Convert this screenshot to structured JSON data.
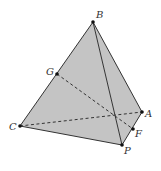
{
  "figure": {
    "colors": {
      "face_fill": "#c4c4c4",
      "edge": "#333333",
      "point": "#111111",
      "label": "#333333",
      "background": "#ffffff"
    },
    "points": [
      {
        "id": "B",
        "label": "B"
      },
      {
        "id": "C",
        "label": "C"
      },
      {
        "id": "P",
        "label": "P"
      },
      {
        "id": "A",
        "label": "A"
      },
      {
        "id": "G",
        "label": "G"
      },
      {
        "id": "F",
        "label": "F"
      }
    ],
    "solid_edges": [
      [
        "B",
        "C"
      ],
      [
        "C",
        "P"
      ],
      [
        "P",
        "A"
      ],
      [
        "A",
        "B"
      ],
      [
        "B",
        "P"
      ]
    ],
    "dashed_edges": [
      [
        "C",
        "A"
      ],
      [
        "G",
        "F"
      ]
    ],
    "faces_shaded": [
      [
        "B",
        "C",
        "P"
      ],
      [
        "B",
        "P",
        "A"
      ]
    ]
  }
}
